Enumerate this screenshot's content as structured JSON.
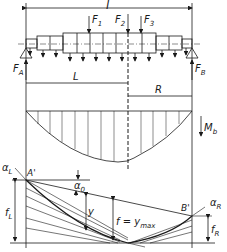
{
  "diagram": {
    "type": "shaft-bending-deflection",
    "labels": {
      "span": "l",
      "force1": "F",
      "force1_sub": "1",
      "force2": "F",
      "force2_sub": "2",
      "force3": "F",
      "force3_sub": "3",
      "reactionA": "F",
      "reactionA_sub": "A",
      "reactionB": "F",
      "reactionB_sub": "B",
      "leftLength": "L",
      "rightLength": "R",
      "moment": "M",
      "moment_sub": "b",
      "alphaL": "α",
      "alphaL_sub": "L",
      "alpha0": "α",
      "alpha0_sub": "0",
      "alphaR": "α",
      "alphaR_sub": "R",
      "pointA": "A'",
      "pointB": "B'",
      "y": "y",
      "fmax": "f = y",
      "fmax_sub": "max",
      "fL": "f",
      "fL_sub": "L",
      "fR": "f",
      "fR_sub": "R"
    },
    "colors": {
      "line": "#1a1a1a",
      "background": "#ffffff"
    }
  }
}
